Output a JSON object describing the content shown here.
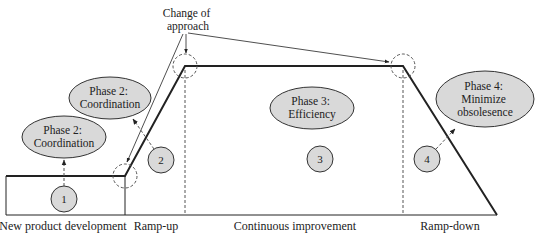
{
  "annotation": {
    "line1": "Change of",
    "line2": "approach"
  },
  "phases": [
    {
      "id": "phase2-upper",
      "line1": "Phase 2:",
      "line2": "Coordination"
    },
    {
      "id": "phase2-lower",
      "line1": "Phase 2:",
      "line2": "Coordination"
    },
    {
      "id": "phase3",
      "line1": "Phase 3:",
      "line2": "Efficiency"
    },
    {
      "id": "phase4",
      "line1": "Phase 4:",
      "line2": "Minimize",
      "line3": "obsolesence"
    }
  ],
  "markers": [
    "1",
    "2",
    "3",
    "4"
  ],
  "stages": [
    "New product development",
    "Ramp-up",
    "Continuous improvement",
    "Ramp-down"
  ],
  "colors": {
    "ellipse_fill": "#d9d9d9",
    "stroke": "#222222",
    "dashed": "#555555"
  }
}
